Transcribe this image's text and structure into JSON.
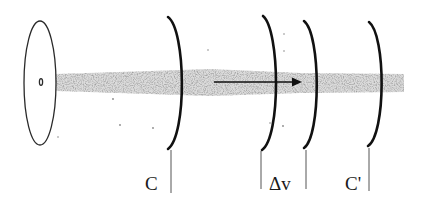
{
  "diagram": {
    "type": "beam-through-wavefronts",
    "source": {
      "mark": "0"
    },
    "labels": {
      "c": "C",
      "delta_v": "Δv",
      "c_prime": "C'"
    },
    "colors": {
      "ink": "#1a1a1a",
      "beam": "#8a8a8a",
      "background": "#ffffff"
    }
  }
}
